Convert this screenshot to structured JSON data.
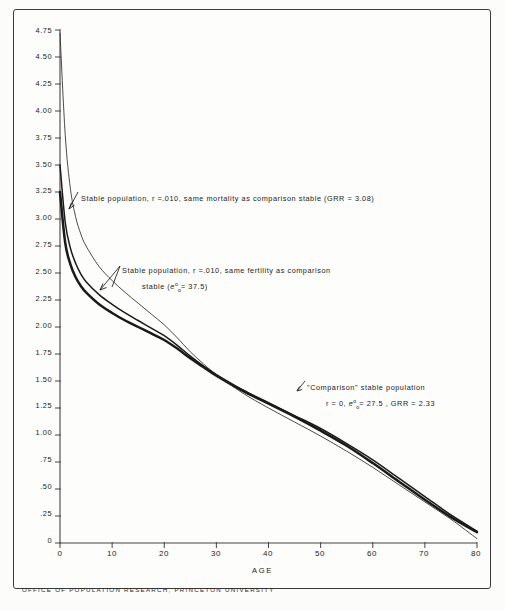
{
  "figure": {
    "footer": "OFFICE OF POPULATION RESEARCH, PRINCETON UNIVERSITY",
    "border_color": "#3a3a3a",
    "background": "#fdfdfb"
  },
  "annotations": [
    {
      "id": "ann-mortality",
      "text": "Stable population, r =.010, same  mortality  as  comparison  stable  (GRR = 3.08)",
      "target_curve": "same-mortality"
    },
    {
      "id": "ann-fertility-line1",
      "text": "Stable population, r =.010, same  fertility  as   comparison",
      "line2_pre": "stable   (",
      "line2_symbol": "e",
      "line2_sup": "o",
      "line2_sub": "o",
      "line2_post": "= 37.5)",
      "target_curve": "same-fertility"
    },
    {
      "id": "ann-comparison-line1",
      "text": "\"Comparison\"  stable  population",
      "line2_pre": "r = 0,   ",
      "line2_symbol": "e",
      "line2_sup": "o",
      "line2_sub": "o",
      "line2_post": "= 27.5 ,   GRR = 2.33",
      "target_curve": "comparison"
    }
  ],
  "chart_data": {
    "type": "line",
    "title": "",
    "xlabel": "AGE",
    "ylabel": "",
    "xlim": [
      0,
      80
    ],
    "ylim": [
      0,
      4.75
    ],
    "grid": false,
    "legend": "annotations-inline",
    "xticks": [
      0,
      10,
      20,
      30,
      40,
      50,
      60,
      70,
      80
    ],
    "xtick_labels": [
      "0",
      "10",
      "20",
      "30",
      "40",
      "50",
      "60",
      "70",
      "80"
    ],
    "yticks": [
      0,
      0.25,
      0.5,
      0.75,
      1.0,
      1.25,
      1.5,
      1.75,
      2.0,
      2.25,
      2.5,
      2.75,
      3.0,
      3.25,
      3.5,
      3.75,
      4.0,
      4.25,
      4.5,
      4.75
    ],
    "ytick_labels": [
      "0",
      ".25",
      ".50",
      ".75",
      "1.00",
      "1.25",
      "1.50",
      "1.75",
      "2.00",
      "2.25",
      "2.50",
      "2.75",
      "3.00",
      "3.25",
      "3.50",
      "3.75",
      "4.00",
      "4.25",
      "4.50",
      "4.75"
    ],
    "x": [
      0,
      1,
      2,
      3,
      4,
      5,
      7.5,
      10,
      12.5,
      15,
      17.5,
      20,
      22.5,
      25,
      27.5,
      30,
      35,
      40,
      45,
      50,
      55,
      60,
      65,
      70,
      75,
      80
    ],
    "series": [
      {
        "name": "same-mortality",
        "label": "Stable population, r=.010, same mortality as comparison stable (GRR = 3.08)",
        "stroke_width": 2.5,
        "color": "#1a1a1a",
        "values": [
          3.25,
          2.78,
          2.58,
          2.46,
          2.38,
          2.32,
          2.21,
          2.13,
          2.06,
          2.0,
          1.94,
          1.88,
          1.8,
          1.71,
          1.63,
          1.55,
          1.41,
          1.29,
          1.17,
          1.04,
          0.9,
          0.74,
          0.57,
          0.4,
          0.24,
          0.1
        ]
      },
      {
        "name": "same-fertility",
        "label": "Stable population, r=.010, same fertility as comparison stable (e00 = 37.5)",
        "stroke_width": 1.5,
        "color": "#1a1a1a",
        "values": [
          3.5,
          2.97,
          2.73,
          2.59,
          2.49,
          2.42,
          2.3,
          2.21,
          2.13,
          2.06,
          1.99,
          1.92,
          1.83,
          1.73,
          1.64,
          1.56,
          1.42,
          1.3,
          1.18,
          1.06,
          0.92,
          0.77,
          0.6,
          0.43,
          0.26,
          0.11
        ]
      },
      {
        "name": "comparison",
        "label": "\"Comparison\" stable population r=0, e00=27.5, GRR=2.33",
        "stroke_width": 0.85,
        "color": "#2a2a2a",
        "values": [
          4.72,
          3.78,
          3.28,
          3.02,
          2.86,
          2.75,
          2.56,
          2.43,
          2.32,
          2.22,
          2.12,
          2.02,
          1.9,
          1.77,
          1.66,
          1.56,
          1.39,
          1.25,
          1.12,
          0.99,
          0.85,
          0.7,
          0.54,
          0.38,
          0.22,
          0.04
        ]
      }
    ]
  }
}
